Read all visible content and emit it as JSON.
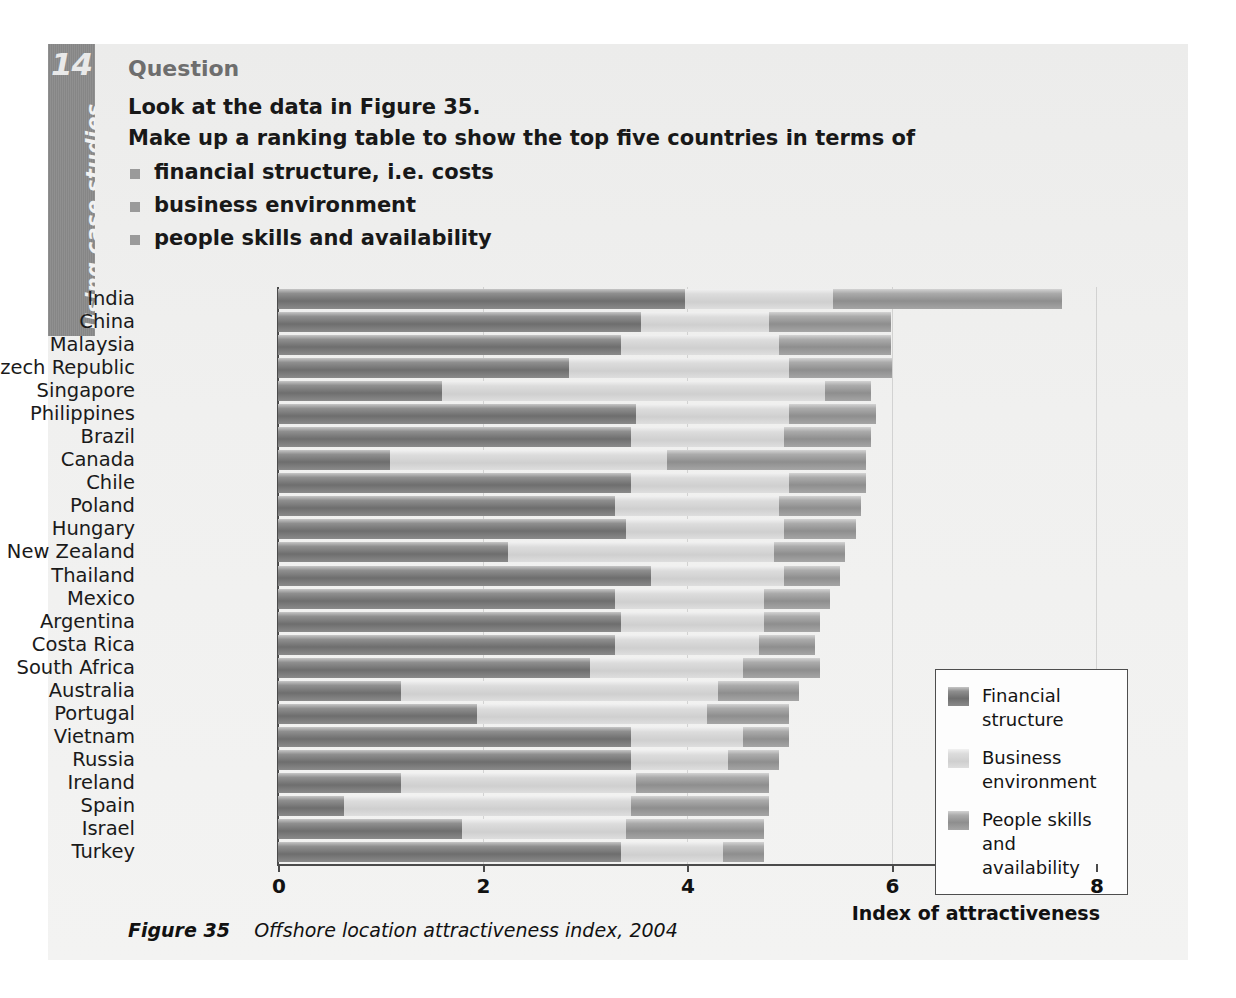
{
  "sidebar": {
    "chapter_number": "14",
    "chapter_label": "Using case studies"
  },
  "question": {
    "heading": "Question",
    "line1": "Look at the data in Figure 35.",
    "line2": "Make up a ranking table to show the top five countries in terms of",
    "bullets": [
      "financial structure, i.e. costs",
      "business environment",
      "people skills and availability"
    ]
  },
  "caption": {
    "figure_label": "Figure 35",
    "figure_text": "Offshore location attractiveness index, 2004"
  },
  "colors": {
    "financial_structure": "#6e6e6e",
    "business_environment": "#d4d4d4",
    "people_skills": "#9a9a9a",
    "sidebar": "#8a8a8a",
    "page_background": "#f0f0ef"
  },
  "chart_data": {
    "type": "bar",
    "orientation": "horizontal",
    "stacked": true,
    "title": "Offshore location attractiveness index, 2004",
    "xlabel": "Index of attractiveness",
    "ylabel": "",
    "xlim": [
      0,
      8
    ],
    "xticks": [
      "0",
      "2",
      "4",
      "6",
      "8"
    ],
    "xtick_values": [
      0,
      2,
      4,
      6,
      8
    ],
    "grid": true,
    "legend_position": "inside-right",
    "categories": [
      "India",
      "China",
      "Malaysia",
      "Czech Republic",
      "Singapore",
      "Philippines",
      "Brazil",
      "Canada",
      "Chile",
      "Poland",
      "Hungary",
      "New Zealand",
      "Thailand",
      "Mexico",
      "Argentina",
      "Costa Rica",
      "South Africa",
      "Australia",
      "Portugal",
      "Vietnam",
      "Russia",
      "Ireland",
      "Spain",
      "Israel",
      "Turkey"
    ],
    "series": [
      {
        "name": "Financial structure",
        "color": "#6e6e6e",
        "values": [
          3.98,
          3.55,
          3.35,
          2.85,
          1.6,
          3.5,
          3.45,
          1.1,
          3.45,
          3.3,
          3.4,
          2.25,
          3.65,
          3.3,
          3.35,
          3.3,
          3.05,
          1.2,
          1.95,
          3.45,
          3.45,
          1.2,
          0.65,
          1.8,
          3.35
        ]
      },
      {
        "name": "Business environment",
        "color": "#d4d4d4",
        "values": [
          1.45,
          1.25,
          1.55,
          2.15,
          3.75,
          1.5,
          1.5,
          2.7,
          1.55,
          1.6,
          1.55,
          2.6,
          1.3,
          1.45,
          1.4,
          1.4,
          1.5,
          3.1,
          2.25,
          1.1,
          0.95,
          2.3,
          2.8,
          1.6,
          1.0
        ]
      },
      {
        "name": "People skills and availability",
        "color": "#9a9a9a",
        "values": [
          2.24,
          1.2,
          1.1,
          1.0,
          0.45,
          0.85,
          0.85,
          1.95,
          0.75,
          0.8,
          0.7,
          0.7,
          0.55,
          0.65,
          0.55,
          0.55,
          0.75,
          0.8,
          0.8,
          0.45,
          0.5,
          1.3,
          1.35,
          1.35,
          0.4
        ]
      }
    ]
  },
  "legend": {
    "items": [
      {
        "label": "Financial\nstructure",
        "line1": "Financial",
        "line2": "structure",
        "swatch": "financial-structure-swatch"
      },
      {
        "label": "Business\nenvironment",
        "line1": "Business",
        "line2": "environment",
        "swatch": "business-environment-swatch"
      },
      {
        "label": "People skills\nand availability",
        "line1": "People skills",
        "line2": "and availability",
        "swatch": "people-skills-swatch"
      }
    ]
  }
}
